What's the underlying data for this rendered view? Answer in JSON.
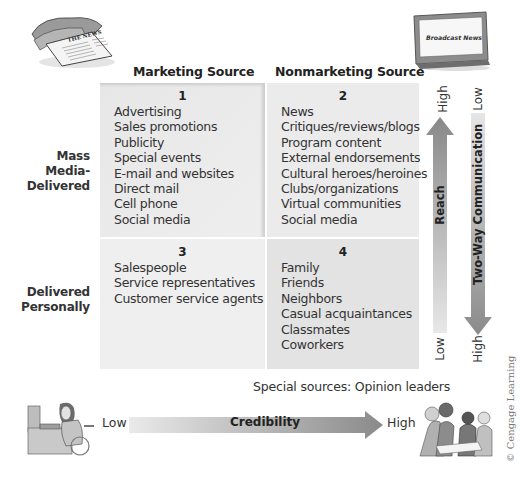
{
  "columns": {
    "marketing": "Marketing Source",
    "nonmarketing": "Nonmarketing Source"
  },
  "rows": {
    "mass_media": [
      "Mass",
      "Media-",
      "Delivered"
    ],
    "personal": [
      "Delivered",
      "Personally"
    ]
  },
  "quadrants": [
    {
      "number": "1",
      "items": [
        "Advertising",
        "Sales promotions",
        "Publicity",
        "Special events",
        "E-mail and websites",
        "Direct mail",
        "Cell phone",
        "Social media"
      ]
    },
    {
      "number": "2",
      "items": [
        "News",
        "Critiques/reviews/blogs",
        "Program content",
        "External endorsements",
        "Cultural heroes/heroines",
        "Clubs/organizations",
        "Virtual communities",
        "Social media"
      ]
    },
    {
      "number": "3",
      "items": [
        "Salespeople",
        "Service representatives",
        "Customer service agents"
      ]
    },
    {
      "number": "4",
      "items": [
        "Family",
        "Friends",
        "Neighbors",
        "Casual acquaintances",
        "Classmates",
        "Coworkers"
      ]
    }
  ],
  "reach_arrow": {
    "label": "Reach",
    "top": "High",
    "bottom": "Low",
    "direction": "up"
  },
  "two_way_arrow": {
    "label": "Two-Way Communication",
    "top": "Low",
    "bottom": "High",
    "direction": "down"
  },
  "credibility_arrow": {
    "label": "Credibility",
    "left": "Low",
    "right": "High",
    "direction": "right"
  },
  "special_sources": "Special sources: Opinion leaders",
  "illustrations": {
    "newspaper_headline": "THE NEWS",
    "tv_screen": "Broadcast News"
  },
  "copyright": "© Cengage Learning",
  "colors": {
    "quad_bg": "#ececec",
    "arrow_dark": "#8a8a8a",
    "arrow_light": "#e6e6e6"
  }
}
